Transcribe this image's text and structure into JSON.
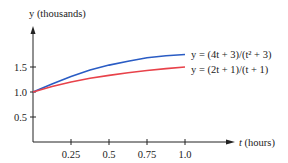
{
  "chart_data": {
    "type": "line",
    "title": "",
    "xlabel": "t (hours)",
    "ylabel": "y (thousands)",
    "xlim": [
      0,
      1.0
    ],
    "ylim": [
      0,
      2.0
    ],
    "x_ticks": [
      "0.25",
      "0.5",
      "0.75",
      "1.0"
    ],
    "y_ticks": [
      "0.5",
      "1.0",
      "1.5"
    ],
    "grid": false,
    "legend_position": "inline-right",
    "x": [
      0,
      0.125,
      0.25,
      0.375,
      0.5,
      0.625,
      0.75,
      0.875,
      1.0
    ],
    "series": [
      {
        "name": "y = (4t + 3)/(t² + 3)",
        "color": "#2a5cc4",
        "values": [
          1.0,
          1.161,
          1.311,
          1.44,
          1.538,
          1.617,
          1.684,
          1.724,
          1.75
        ]
      },
      {
        "name": "y = (2t + 1)/(t + 1)",
        "color": "#e8424a",
        "values": [
          1.0,
          1.111,
          1.2,
          1.273,
          1.333,
          1.385,
          1.429,
          1.467,
          1.5
        ]
      }
    ]
  },
  "labels": {
    "y_axis": "y (thousands)",
    "x_axis_var": "t",
    "x_axis_unit": " (hours)",
    "series1_label": "y = (4t + 3)/(t² + 3)",
    "series2_label": "y = (2t + 1)/(t + 1)",
    "tick_x": [
      "0.25",
      "0.5",
      "0.75",
      "1.0"
    ],
    "tick_y": [
      "0.5",
      "1.0",
      "1.5"
    ]
  }
}
